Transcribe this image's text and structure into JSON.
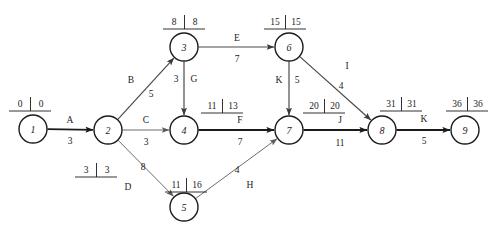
{
  "diagram": {
    "type": "activity-on-arrow-network",
    "nodes": [
      {
        "id": "1",
        "label": "1",
        "x": 33,
        "y": 129,
        "r": 14,
        "early": "0",
        "late": "0",
        "tag_x": 30,
        "tag_y": 104
      },
      {
        "id": "2",
        "label": "2",
        "x": 108,
        "y": 130,
        "r": 14,
        "early": "3",
        "late": "3",
        "tag_x": 96,
        "tag_y": 170
      },
      {
        "id": "3",
        "label": "3",
        "x": 184,
        "y": 47,
        "r": 14,
        "early": "8",
        "late": "8",
        "tag_x": 184,
        "tag_y": 22
      },
      {
        "id": "4",
        "label": "4",
        "x": 184,
        "y": 130,
        "r": 14,
        "early": "11",
        "late": "13",
        "tag_x": 222,
        "tag_y": 106
      },
      {
        "id": "5",
        "label": "5",
        "x": 184,
        "y": 207,
        "r": 14,
        "early": "11",
        "late": "16",
        "tag_x": 186,
        "tag_y": 185
      },
      {
        "id": "6",
        "label": "6",
        "x": 289,
        "y": 47,
        "r": 14,
        "early": "15",
        "late": "15",
        "tag_x": 285,
        "tag_y": 22
      },
      {
        "id": "7",
        "label": "7",
        "x": 289,
        "y": 130,
        "r": 14,
        "early": "20",
        "late": "20",
        "tag_x": 324,
        "tag_y": 106
      },
      {
        "id": "8",
        "label": "8",
        "x": 382,
        "y": 130,
        "r": 14,
        "early": "31",
        "late": "31",
        "tag_x": 401,
        "tag_y": 104
      },
      {
        "id": "9",
        "label": "9",
        "x": 465,
        "y": 130,
        "r": 14,
        "early": "36",
        "late": "36",
        "tag_x": 467,
        "tag_y": 104
      }
    ],
    "edges": [
      {
        "id": "A",
        "from": "1",
        "to": "2",
        "activity": "A",
        "duration": "3",
        "weight": "heavy",
        "act_x": 70,
        "act_y": 120,
        "dur_x": 70,
        "dur_y": 141
      },
      {
        "id": "B",
        "from": "2",
        "to": "3",
        "activity": "B",
        "duration": "5",
        "weight": "mid",
        "act_x": 131,
        "act_y": 80,
        "dur_x": 151,
        "dur_y": 94
      },
      {
        "id": "C",
        "from": "2",
        "to": "4",
        "activity": "C",
        "duration": "3",
        "weight": "light",
        "act_x": 146,
        "act_y": 120,
        "dur_x": 146,
        "dur_y": 142
      },
      {
        "id": "D",
        "from": "2",
        "to": "5",
        "activity": "D",
        "duration": "8",
        "weight": "light",
        "act_x": 128,
        "act_y": 187,
        "dur_x": 143,
        "dur_y": 167
      },
      {
        "id": "E",
        "from": "3",
        "to": "6",
        "activity": "E",
        "duration": "7",
        "weight": "mid",
        "act_x": 237,
        "act_y": 38,
        "dur_x": 237,
        "dur_y": 59
      },
      {
        "id": "G",
        "from": "3",
        "to": "4",
        "activity": "G",
        "duration": "3",
        "weight": "mid",
        "act_x": 194,
        "act_y": 79,
        "dur_x": 176,
        "dur_y": 79
      },
      {
        "id": "F",
        "from": "4",
        "to": "7",
        "activity": "F",
        "duration": "7",
        "weight": "heavy",
        "act_x": 240,
        "act_y": 120,
        "dur_x": 240,
        "dur_y": 142
      },
      {
        "id": "H",
        "from": "5",
        "to": "7",
        "activity": "H",
        "duration": "4",
        "weight": "light",
        "act_x": 250,
        "act_y": 185,
        "dur_x": 237,
        "dur_y": 170
      },
      {
        "id": "K1",
        "from": "6",
        "to": "7",
        "activity": "K",
        "duration": "5",
        "weight": "mid",
        "act_x": 279,
        "act_y": 80,
        "dur_x": 297,
        "dur_y": 80
      },
      {
        "id": "I",
        "from": "6",
        "to": "8",
        "activity": "I",
        "duration": "4",
        "weight": "mid",
        "act_x": 347,
        "act_y": 66,
        "dur_x": 341,
        "dur_y": 86
      },
      {
        "id": "J",
        "from": "7",
        "to": "8",
        "activity": "J",
        "duration": "11",
        "weight": "heavy",
        "act_x": 340,
        "act_y": 120,
        "dur_x": 340,
        "dur_y": 143
      },
      {
        "id": "K2",
        "from": "8",
        "to": "9",
        "activity": "K",
        "duration": "5",
        "weight": "heavy",
        "act_x": 424,
        "act_y": 119,
        "dur_x": 424,
        "dur_y": 141
      }
    ],
    "colors": {
      "ink": "#1b1b1b",
      "line_heavy": "#1b1b1b",
      "line_mid": "#4a4a4a",
      "line_light": "#6d6d6d",
      "background": "#ffffff"
    }
  }
}
